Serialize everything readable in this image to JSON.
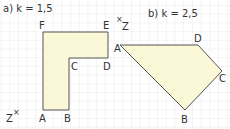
{
  "colors": {
    "grid": "#e3e3e3",
    "fill": "#fbf8d8",
    "stroke": "#555555",
    "text": "#333333"
  },
  "part_a": {
    "title": "a)  k = 1,5",
    "center_label": "Z",
    "center_marker": "×",
    "vertices": [
      {
        "name": "A",
        "x": 43,
        "y": 110
      },
      {
        "name": "B",
        "x": 69,
        "y": 110
      },
      {
        "name": "C",
        "x": 69,
        "y": 58
      },
      {
        "name": "D",
        "x": 108,
        "y": 58
      },
      {
        "name": "E",
        "x": 108,
        "y": 32
      },
      {
        "name": "F",
        "x": 43,
        "y": 32
      }
    ]
  },
  "part_b": {
    "title": "b)  k = 2,5",
    "center_label": "Z",
    "center_marker": "×",
    "vertices": [
      {
        "name": "A",
        "x": 120,
        "y": 45
      },
      {
        "name": "B",
        "x": 185,
        "y": 110
      },
      {
        "name": "C",
        "x": 222,
        "y": 71
      },
      {
        "name": "D",
        "x": 198,
        "y": 45
      }
    ]
  }
}
